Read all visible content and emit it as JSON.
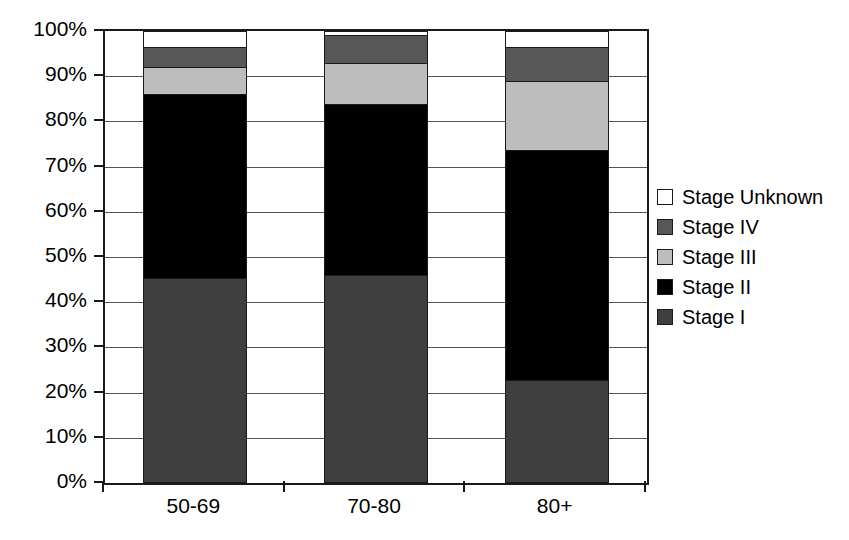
{
  "chart_data": {
    "type": "bar",
    "subtype": "stacked-percentage",
    "title": "",
    "xlabel": "",
    "ylabel": "",
    "categories": [
      "50-69",
      "70-80",
      "80+"
    ],
    "ylim": [
      0,
      100
    ],
    "ytick_labels": [
      "0%",
      "10%",
      "20%",
      "30%",
      "40%",
      "50%",
      "60%",
      "70%",
      "80%",
      "90%",
      "100%"
    ],
    "ytick_values": [
      0,
      10,
      20,
      30,
      40,
      50,
      60,
      70,
      80,
      90,
      100
    ],
    "grid": true,
    "legend_position": "right",
    "stack_order_bottom_to_top": [
      "Stage I",
      "Stage II",
      "Stage III",
      "Stage IV",
      "Stage Unknown"
    ],
    "series": [
      {
        "name": "Stage I",
        "color": "#3f3f3f",
        "values": [
          45.4,
          46.1,
          22.7
        ]
      },
      {
        "name": "Stage II",
        "color": "#000000",
        "values": [
          40.6,
          37.7,
          50.9
        ]
      },
      {
        "name": "Stage III",
        "color": "#bdbdbd",
        "values": [
          6.0,
          9.2,
          15.3
        ]
      },
      {
        "name": "Stage IV",
        "color": "#575757",
        "values": [
          4.4,
          6.2,
          7.5
        ]
      },
      {
        "name": "Stage Unknown",
        "color": "#ffffff",
        "values": [
          3.6,
          0.8,
          3.6
        ]
      }
    ],
    "cumulative_tops": [
      [
        45.4,
        86.0,
        92.0,
        96.4,
        100.0
      ],
      [
        46.1,
        83.8,
        93.0,
        99.2,
        100.0
      ],
      [
        22.7,
        73.6,
        88.9,
        96.4,
        100.0
      ]
    ]
  },
  "legend": {
    "items": [
      {
        "label": "Stage Unknown",
        "color": "#ffffff"
      },
      {
        "label": "Stage IV",
        "color": "#575757"
      },
      {
        "label": "Stage III",
        "color": "#bdbdbd"
      },
      {
        "label": "Stage II",
        "color": "#000000"
      },
      {
        "label": "Stage I",
        "color": "#3f3f3f"
      }
    ]
  },
  "colors": {
    "axis": "#1a1a1a",
    "gridline": "#555555",
    "background": "#ffffff",
    "text": "#000000"
  }
}
